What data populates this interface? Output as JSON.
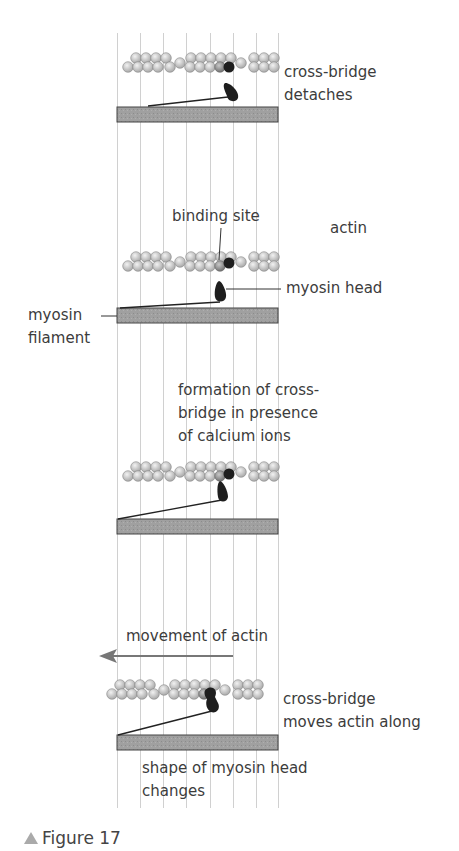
{
  "figure": {
    "caption": "Figure 17",
    "panels": [
      {
        "id": "detach",
        "labels": [
          "cross-bridge",
          "detaches"
        ]
      },
      {
        "id": "resting",
        "labels": {
          "binding_site": "binding site",
          "actin": "actin",
          "myosin_head": "myosin head",
          "myosin_filament_1": "myosin",
          "myosin_filament_2": "filament"
        }
      },
      {
        "id": "formation",
        "labels": [
          "formation of cross-",
          "bridge in presence",
          "of calcium ions"
        ]
      },
      {
        "id": "power-stroke",
        "labels": {
          "movement": "movement of actin",
          "moves_1": "cross-bridge",
          "moves_2": "moves actin along",
          "shape_1": "shape of myosin head",
          "shape_2": "changes"
        }
      }
    ]
  },
  "colors": {
    "bar": "#9a9a9a",
    "bead": "#d9d9d9",
    "head": "#1e1e1e",
    "arrow": "#777777",
    "grid": "#cfcfcf"
  }
}
